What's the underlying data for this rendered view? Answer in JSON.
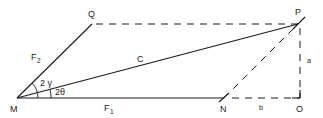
{
  "diagram": {
    "points": {
      "M": {
        "label": "M",
        "x": 17,
        "y": 98
      },
      "Q": {
        "label": "Q",
        "x": 92,
        "y": 24
      },
      "P": {
        "label": "P",
        "x": 298,
        "y": 24
      },
      "N": {
        "label": "N",
        "x": 224,
        "y": 98
      },
      "O": {
        "label": "O",
        "x": 300,
        "y": 98
      }
    },
    "segments": [
      {
        "from": "M",
        "to": "Q",
        "style": "solid",
        "label": "F",
        "subscript": "2"
      },
      {
        "from": "M",
        "to": "P",
        "style": "solid",
        "label": "C"
      },
      {
        "from": "M",
        "to": "N",
        "style": "solid",
        "label": "F",
        "subscript": "1"
      },
      {
        "from": "Q",
        "to": "P",
        "style": "dashed"
      },
      {
        "from": "N",
        "to": "P",
        "style": "dashed"
      },
      {
        "from": "N",
        "to": "O",
        "style": "dashed",
        "label": "b"
      },
      {
        "from": "P",
        "to": "O",
        "style": "dashed",
        "label": "a"
      }
    ],
    "angles": [
      {
        "vertex": "M",
        "label": "2 γ",
        "between": [
          "MN",
          "MQ"
        ]
      },
      {
        "vertex": "M",
        "label": "2θ",
        "between": [
          "MN",
          "MP"
        ]
      }
    ],
    "labels": {
      "M": "M",
      "Q": "Q",
      "P": "P",
      "N": "N",
      "O": "O",
      "F2_main": "F",
      "F2_sub": "2",
      "F1_main": "F",
      "F1_sub": "1",
      "C": "C",
      "b": "b",
      "a": "a",
      "gamma_angle": "2 γ",
      "theta_angle": "2θ"
    },
    "colors": {
      "stroke": "#1a1a1a",
      "background": "#ffffff"
    }
  }
}
